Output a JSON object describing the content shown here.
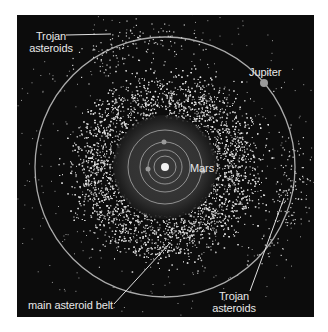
{
  "diagram": {
    "title": "",
    "colors": {
      "background": "#0c0c0c",
      "page": "#ffffff",
      "orbit": "#bdbdbd",
      "asteroid": "#d8d8d8",
      "label": "#e8e8e8",
      "sun": "#f2f2f2",
      "planet": "#9a9a9a"
    },
    "labels": {
      "trojan_top_line1": "Trojan",
      "trojan_top_line2": "asteroids",
      "jupiter": "Jupiter",
      "mars": "Mars",
      "main_belt": "main asteroid belt",
      "trojan_bottom_line1": "Trojan",
      "trojan_bottom_line2": "asteroids"
    },
    "bodies": [
      {
        "name": "Sun",
        "cx": 165,
        "cy": 167,
        "r": 4
      },
      {
        "name": "inner planet",
        "cx": 148,
        "cy": 169,
        "r": 2.5,
        "orbit_r": 17
      },
      {
        "name": "Earth",
        "cx": 164,
        "cy": 142,
        "r": 2.5,
        "orbit_r": 25
      },
      {
        "name": "Mars",
        "cx": 203,
        "cy": 171,
        "r": 2.5,
        "orbit_r": 37
      },
      {
        "name": "Jupiter",
        "cx": 264,
        "cy": 83,
        "r": 4,
        "orbit_r": 130
      }
    ],
    "orbits_r": [
      11,
      17,
      25,
      37,
      130
    ],
    "belt": {
      "inner_r": 45,
      "peak_r": 72,
      "outer_r": 108,
      "count": 5200
    },
    "trojans": {
      "l4_angle_deg": -106,
      "l5_angle_deg": 14,
      "count": 260
    }
  }
}
